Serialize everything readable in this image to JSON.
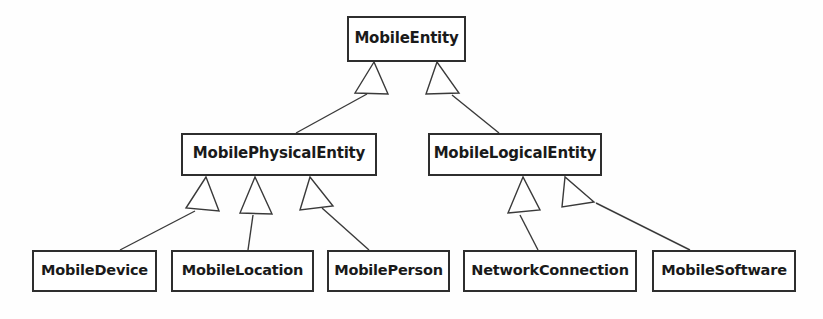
{
  "diagram": {
    "kind": "uml-class-hierarchy",
    "relationship": "generalization",
    "arrow_style": "hollow-triangle",
    "colors": {
      "background": "#ffffff",
      "node_fill": "#ffffff",
      "node_border": "#2e2e2e",
      "edge_line": "#3a3a3a",
      "label_text": "#1a1a1a"
    },
    "nodes": [
      {
        "id": "mobile-entity",
        "label": "MobileEntity",
        "tier": "root",
        "x": 347,
        "y": 16,
        "w": 119,
        "h": 46
      },
      {
        "id": "mobile-physical-entity",
        "label": "MobilePhysicalEntity",
        "tier": "mid",
        "x": 181,
        "y": 133,
        "w": 196,
        "h": 43
      },
      {
        "id": "mobile-logical-entity",
        "label": "MobileLogicalEntity",
        "tier": "mid",
        "x": 428,
        "y": 133,
        "w": 174,
        "h": 43
      },
      {
        "id": "mobile-device",
        "label": "MobileDevice",
        "tier": "leaf",
        "x": 32,
        "y": 250,
        "w": 125,
        "h": 42
      },
      {
        "id": "mobile-location",
        "label": "MobileLocation",
        "tier": "leaf",
        "x": 171,
        "y": 250,
        "w": 143,
        "h": 42
      },
      {
        "id": "mobile-person",
        "label": "MobilePerson",
        "tier": "leaf",
        "x": 327,
        "y": 250,
        "w": 123,
        "h": 42
      },
      {
        "id": "network-connection",
        "label": "NetworkConnection",
        "tier": "leaf",
        "x": 463,
        "y": 250,
        "w": 174,
        "h": 42
      },
      {
        "id": "mobile-software",
        "label": "MobileSoftware",
        "tier": "leaf",
        "x": 652,
        "y": 250,
        "w": 144,
        "h": 42
      }
    ],
    "edges": [
      {
        "id": "edge-physical-to-entity",
        "from": "mobile-physical-entity",
        "to": "mobile-entity"
      },
      {
        "id": "edge-logical-to-entity",
        "from": "mobile-logical-entity",
        "to": "mobile-entity"
      },
      {
        "id": "edge-device-to-physical",
        "from": "mobile-device",
        "to": "mobile-physical-entity"
      },
      {
        "id": "edge-location-to-physical",
        "from": "mobile-location",
        "to": "mobile-physical-entity"
      },
      {
        "id": "edge-person-to-physical",
        "from": "mobile-person",
        "to": "mobile-physical-entity"
      },
      {
        "id": "edge-network-to-logical",
        "from": "network-connection",
        "to": "mobile-logical-entity"
      },
      {
        "id": "edge-software-to-logical",
        "from": "mobile-software",
        "to": "mobile-logical-entity"
      }
    ]
  }
}
